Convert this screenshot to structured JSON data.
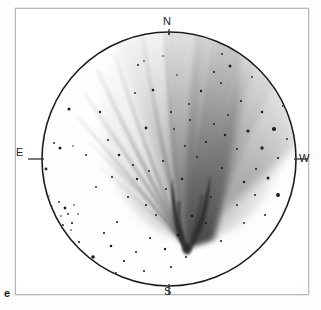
{
  "figure": {
    "letter": "e",
    "caption_letter_position": "bottom-left-outside-frame",
    "medium": "negative print astronomical photograph"
  },
  "frame": {
    "border_color": "#b9b9b9",
    "background_color": "#ffffff",
    "x": 15,
    "y": 8,
    "width": 292,
    "height": 285
  },
  "field_of_view": {
    "shape": "circle",
    "center_x": 153,
    "center_y": 150,
    "radius": 127,
    "stroke_color": "#1b1b1b",
    "stroke_width": 1.6
  },
  "orientation": {
    "labels": [
      {
        "name": "north",
        "text": "N",
        "angle_deg": 90,
        "tick": true
      },
      {
        "name": "east",
        "text": "E",
        "angle_deg": 180,
        "tick": true
      },
      {
        "name": "south",
        "text": "S",
        "angle_deg": 270,
        "tick": true
      },
      {
        "name": "west",
        "text": "W",
        "angle_deg": 0,
        "tick": true
      }
    ],
    "tick_length": 22,
    "tick_color": "#333333"
  },
  "comet": {
    "nucleus_x": 170,
    "nucleus_y": 235,
    "tail_direction": "north to north-northwest",
    "tail_opening_deg": 70,
    "ink_color": "#555555",
    "features": [
      "sharp dark parabolic nucleus/head at lower centre",
      "broad dark dust tail fanning toward N",
      "fine striae / rays fanning toward NE (upper left)",
      "diffuse grey tail envelope widening toward the circle edge"
    ]
  },
  "star_field": {
    "star_color": "#1d1d1d",
    "description": "scattered star images, densest clump near lower-left rim"
  },
  "chart_data": {
    "type": "scatter",
    "title": "",
    "xlabel": "",
    "ylabel": "",
    "note": "Star positions in field-local pixel coordinates (origin = frame top-left). r = drawn radius in px.",
    "stars": [
      {
        "x": 130,
        "y": 119,
        "r": 1.4
      },
      {
        "x": 122,
        "y": 56,
        "r": 1.0
      },
      {
        "x": 128,
        "y": 52,
        "r": 0.8
      },
      {
        "x": 137,
        "y": 81,
        "r": 1.3
      },
      {
        "x": 119,
        "y": 84,
        "r": 0.9
      },
      {
        "x": 155,
        "y": 103,
        "r": 1.1
      },
      {
        "x": 174,
        "y": 111,
        "r": 0.9
      },
      {
        "x": 185,
        "y": 82,
        "r": 1.2
      },
      {
        "x": 198,
        "y": 63,
        "r": 1.1
      },
      {
        "x": 205,
        "y": 74,
        "r": 0.9
      },
      {
        "x": 214,
        "y": 57,
        "r": 1.5
      },
      {
        "x": 225,
        "y": 92,
        "r": 1.1
      },
      {
        "x": 236,
        "y": 68,
        "r": 0.9
      },
      {
        "x": 198,
        "y": 115,
        "r": 1.0
      },
      {
        "x": 209,
        "y": 126,
        "r": 1.2
      },
      {
        "x": 232,
        "y": 122,
        "r": 1.6
      },
      {
        "x": 246,
        "y": 103,
        "r": 1.3
      },
      {
        "x": 221,
        "y": 140,
        "r": 1.0
      },
      {
        "x": 246,
        "y": 139,
        "r": 1.7
      },
      {
        "x": 258,
        "y": 120,
        "r": 2.1
      },
      {
        "x": 262,
        "y": 149,
        "r": 1.1
      },
      {
        "x": 240,
        "y": 160,
        "r": 1.0
      },
      {
        "x": 252,
        "y": 169,
        "r": 1.5
      },
      {
        "x": 228,
        "y": 173,
        "r": 1.2
      },
      {
        "x": 239,
        "y": 186,
        "r": 1.0
      },
      {
        "x": 262,
        "y": 186,
        "r": 2.0
      },
      {
        "x": 221,
        "y": 196,
        "r": 0.9
      },
      {
        "x": 249,
        "y": 206,
        "r": 1.0
      },
      {
        "x": 228,
        "y": 214,
        "r": 0.9
      },
      {
        "x": 195,
        "y": 188,
        "r": 1.0
      },
      {
        "x": 206,
        "y": 159,
        "r": 1.1
      },
      {
        "x": 181,
        "y": 148,
        "r": 1.0
      },
      {
        "x": 169,
        "y": 137,
        "r": 1.0
      },
      {
        "x": 166,
        "y": 170,
        "r": 1.2
      },
      {
        "x": 150,
        "y": 180,
        "r": 1.0
      },
      {
        "x": 176,
        "y": 207,
        "r": 1.3
      },
      {
        "x": 162,
        "y": 226,
        "r": 1.4
      },
      {
        "x": 149,
        "y": 240,
        "r": 1.2
      },
      {
        "x": 134,
        "y": 229,
        "r": 1.1
      },
      {
        "x": 120,
        "y": 243,
        "r": 1.0
      },
      {
        "x": 108,
        "y": 252,
        "r": 1.1
      },
      {
        "x": 95,
        "y": 237,
        "r": 1.3
      },
      {
        "x": 101,
        "y": 213,
        "r": 1.0
      },
      {
        "x": 88,
        "y": 224,
        "r": 1.1
      },
      {
        "x": 77,
        "y": 248,
        "r": 1.8
      },
      {
        "x": 63,
        "y": 233,
        "r": 1.1
      },
      {
        "x": 56,
        "y": 214,
        "r": 1.1
      },
      {
        "x": 49,
        "y": 199,
        "r": 1.4
      },
      {
        "x": 43,
        "y": 193,
        "r": 0.9
      },
      {
        "x": 38,
        "y": 203,
        "r": 0.8
      },
      {
        "x": 45,
        "y": 207,
        "r": 0.8
      },
      {
        "x": 52,
        "y": 205,
        "r": 0.9
      },
      {
        "x": 41,
        "y": 211,
        "r": 0.8
      },
      {
        "x": 47,
        "y": 216,
        "r": 0.9
      },
      {
        "x": 55,
        "y": 221,
        "r": 0.8
      },
      {
        "x": 36,
        "y": 197,
        "r": 0.7
      },
      {
        "x": 33,
        "y": 187,
        "r": 0.7
      },
      {
        "x": 58,
        "y": 196,
        "r": 0.8
      },
      {
        "x": 62,
        "y": 205,
        "r": 0.8
      },
      {
        "x": 30,
        "y": 160,
        "r": 1.4
      },
      {
        "x": 26,
        "y": 124,
        "r": 1.9
      },
      {
        "x": 44,
        "y": 139,
        "r": 1.5
      },
      {
        "x": 38,
        "y": 134,
        "r": 0.9
      },
      {
        "x": 57,
        "y": 137,
        "r": 0.8
      },
      {
        "x": 53,
        "y": 100,
        "r": 1.5
      },
      {
        "x": 70,
        "y": 146,
        "r": 0.9
      },
      {
        "x": 84,
        "y": 103,
        "r": 1.2
      },
      {
        "x": 92,
        "y": 131,
        "r": 1.0
      },
      {
        "x": 103,
        "y": 146,
        "r": 1.3
      },
      {
        "x": 117,
        "y": 156,
        "r": 1.1
      },
      {
        "x": 121,
        "y": 170,
        "r": 1.2
      },
      {
        "x": 96,
        "y": 168,
        "r": 1.0
      },
      {
        "x": 80,
        "y": 178,
        "r": 0.9
      },
      {
        "x": 112,
        "y": 188,
        "r": 1.0
      },
      {
        "x": 130,
        "y": 196,
        "r": 1.1
      },
      {
        "x": 140,
        "y": 206,
        "r": 1.0
      },
      {
        "x": 133,
        "y": 162,
        "r": 0.9
      },
      {
        "x": 147,
        "y": 152,
        "r": 1.1
      },
      {
        "x": 158,
        "y": 120,
        "r": 0.9
      },
      {
        "x": 190,
        "y": 133,
        "r": 1.1
      },
      {
        "x": 212,
        "y": 106,
        "r": 0.9
      },
      {
        "x": 173,
        "y": 95,
        "r": 0.9
      },
      {
        "x": 161,
        "y": 66,
        "r": 0.8
      },
      {
        "x": 147,
        "y": 47,
        "r": 0.8
      },
      {
        "x": 206,
        "y": 45,
        "r": 0.9
      },
      {
        "x": 190,
        "y": 214,
        "r": 1.0
      },
      {
        "x": 205,
        "y": 232,
        "r": 1.1
      },
      {
        "x": 170,
        "y": 248,
        "r": 1.0
      },
      {
        "x": 155,
        "y": 258,
        "r": 1.1
      },
      {
        "x": 128,
        "y": 262,
        "r": 1.0
      },
      {
        "x": 100,
        "y": 264,
        "r": 1.0
      },
      {
        "x": 267,
        "y": 97,
        "r": 1.0
      },
      {
        "x": 271,
        "y": 130,
        "r": 0.9
      },
      {
        "x": 259,
        "y": 79,
        "r": 0.9
      }
    ],
    "xlim": [
      0,
      292
    ],
    "ylim": [
      0,
      285
    ],
    "grid": false,
    "legend": false
  }
}
